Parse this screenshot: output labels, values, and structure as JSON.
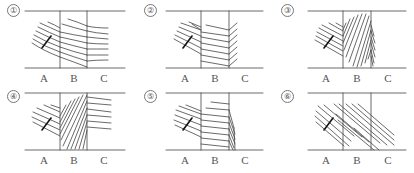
{
  "figure": {
    "panels": [
      {
        "number": "①",
        "labels": [
          "A",
          "B",
          "C"
        ],
        "description": "Lines bend downward entering B, then curve and flatten to nearly horizontal in C"
      },
      {
        "number": "②",
        "labels": [
          "A",
          "B",
          "C"
        ],
        "description": "Lines bend downward entering B, then reflect at the B/C boundary into V shapes"
      },
      {
        "number": "③",
        "labels": [
          "A",
          "B",
          "C"
        ],
        "description": "Dense diagonal hatching fills B in a rounded shape; compressed lines along the B/C boundary"
      },
      {
        "number": "④",
        "labels": [
          "A",
          "B",
          "C"
        ],
        "description": "Dense diagonal hatching fills B; lines in C are nearly horizontal"
      },
      {
        "number": "⑤",
        "labels": [
          "A",
          "B",
          "C"
        ],
        "description": "Lines bend entering B and become nearly horizontal; lines compress into a dense wedge at the B/C boundary"
      },
      {
        "number": "⑥",
        "labels": [
          "A",
          "B",
          "C"
        ],
        "description": "Straight parallel diagonal lines continue unbent from A through B and into C"
      }
    ]
  }
}
